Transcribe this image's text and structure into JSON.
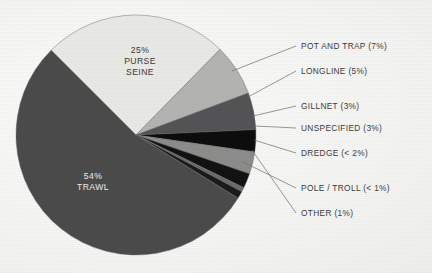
{
  "chart_data": {
    "type": "pie",
    "title": "",
    "subtitle": "",
    "xlabel": "",
    "ylabel": "",
    "legend_position": "right-callouts",
    "grid": false,
    "units": "percent",
    "categories": [
      "TRAWL",
      "PURSE SEINE",
      "POT AND TRAP",
      "LONGLINE",
      "GILLNET",
      "UNSPECIFIED",
      "DREDGE",
      "OTHER",
      "POLE / TROLL"
    ],
    "values": [
      54,
      25,
      7,
      5,
      3,
      3,
      2,
      1,
      0.6
    ],
    "slices": [
      {
        "name": "purse-seine",
        "label": "PURSE SEINE",
        "value_text": "25%",
        "pie_label_line1": "25%",
        "pie_label_line2": "PURSE",
        "pie_label_line3": "SEINE",
        "value": 25,
        "color": "#e9e9e6",
        "label_placement": "inside",
        "label_color": "#39393a"
      },
      {
        "name": "pot-and-trap",
        "label": "POT AND TRAP",
        "value_text": "(7%)",
        "callout_text": "POT AND TRAP (7%)",
        "value": 7,
        "color": "#b4b4b2",
        "label_placement": "callout"
      },
      {
        "name": "longline",
        "label": "LONGLINE",
        "value_text": "(5%)",
        "callout_text": "LONGLINE (5%)",
        "value": 5,
        "color": "#545456",
        "label_placement": "callout"
      },
      {
        "name": "gillnet",
        "label": "GILLNET",
        "value_text": "(3%)",
        "callout_text": "GILLNET (3%)",
        "value": 3,
        "color": "#0d0d0e",
        "label_placement": "callout"
      },
      {
        "name": "unspecified",
        "label": "UNSPECIFIED",
        "value_text": "(3%)",
        "callout_text": "UNSPECIFIED (3%)",
        "value": 3,
        "color": "#8d8d8b",
        "label_placement": "callout"
      },
      {
        "name": "dredge",
        "label": "DREDGE",
        "value_text": "(< 2%)",
        "callout_text": "DREDGE (< 2%)",
        "value": 2,
        "color": "#121213",
        "label_placement": "callout"
      },
      {
        "name": "pole-troll",
        "label": "POLE / TROLL",
        "value_text": "(< 1%)",
        "callout_text": "POLE / TROLL (< 1%)",
        "value": 0.6,
        "color": "#6b6b6c",
        "label_placement": "callout"
      },
      {
        "name": "other",
        "label": "OTHER",
        "value_text": "(1%)",
        "callout_text": "OTHER (1%)",
        "value": 1,
        "color": "#1b1b1c",
        "label_placement": "callout"
      },
      {
        "name": "trawl",
        "label": "TRAWL",
        "value_text": "54%",
        "pie_label_line1": "54%",
        "pie_label_line2": "TRAWL",
        "value": 54,
        "color": "#4b4b4c",
        "label_placement": "inside",
        "label_color": "#f0f0ee"
      }
    ],
    "background_color": "#f2f2f0",
    "outline_color": "#6a6a6a"
  },
  "callouts": [
    {
      "text": "POT AND TRAP (7%)"
    },
    {
      "text": "LONGLINE (5%)"
    },
    {
      "text": "GILLNET (3%)"
    },
    {
      "text": "UNSPECIFIED (3%)"
    },
    {
      "text": "DREDGE (< 2%)"
    },
    {
      "text": "POLE / TROLL (< 1%)"
    },
    {
      "text": "OTHER (1%)"
    }
  ],
  "pie_inside_labels": {
    "purse_seine": {
      "l1": "25%",
      "l2": "PURSE",
      "l3": "SEINE"
    },
    "trawl": {
      "l1": "54%",
      "l2": "TRAWL"
    }
  }
}
